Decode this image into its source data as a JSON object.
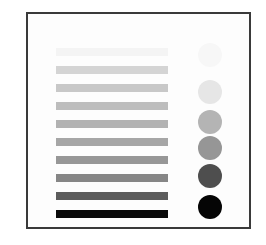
{
  "diagram": {
    "frame_border_color": "#3a3a3a",
    "bars": [
      {
        "top": 48,
        "color": "#f4f4f4"
      },
      {
        "top": 66,
        "color": "#d4d4d4"
      },
      {
        "top": 84,
        "color": "#c8c8c8"
      },
      {
        "top": 102,
        "color": "#bdbdbd"
      },
      {
        "top": 120,
        "color": "#b2b2b2"
      },
      {
        "top": 138,
        "color": "#a6a6a6"
      },
      {
        "top": 156,
        "color": "#979797"
      },
      {
        "top": 174,
        "color": "#868686"
      },
      {
        "top": 192,
        "color": "#5c5c5c"
      },
      {
        "top": 210,
        "color": "#0a0a0a"
      }
    ],
    "circles": [
      {
        "top": 43,
        "color": "#f7f7f7"
      },
      {
        "top": 80,
        "color": "#e6e6e6"
      },
      {
        "top": 110,
        "color": "#b4b4b4"
      },
      {
        "top": 136,
        "color": "#969696"
      },
      {
        "top": 164,
        "color": "#4e4e4e"
      },
      {
        "top": 195,
        "color": "#050505"
      }
    ]
  }
}
